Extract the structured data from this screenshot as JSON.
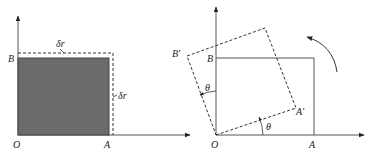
{
  "left_diagram": {
    "labels": {
      "origin": "O",
      "point_a": "A",
      "point_b": "B",
      "delta_top": "δr",
      "delta_right": "δr"
    },
    "fill_color": "#6b6b6b"
  },
  "right_diagram": {
    "labels": {
      "origin": "O",
      "point_a": "A",
      "point_b": "B",
      "point_a_prime": "A'",
      "point_b_prime": "B'",
      "theta_bottom": "θ",
      "theta_left": "θ"
    }
  }
}
